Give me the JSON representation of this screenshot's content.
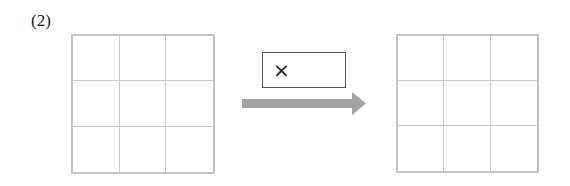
{
  "problem": {
    "number_label": "(2)",
    "operation_symbol": "×",
    "operation_icon": "multiply-icon",
    "arrow_icon": "right-arrow-icon",
    "colors": {
      "grid_border": "#c4c4c4",
      "grid_lines": "#c9c9c9",
      "arrow": "#a3a3a3",
      "box_border": "#555555",
      "text": "#1a1a1a"
    },
    "input_grid": {
      "rows": 3,
      "cols": 3,
      "cells": [
        "",
        "",
        "",
        "",
        "",
        "",
        "",
        "",
        ""
      ]
    },
    "output_grid": {
      "rows": 3,
      "cols": 3,
      "cells": [
        "",
        "",
        "",
        "",
        "",
        "",
        "",
        "",
        ""
      ]
    }
  }
}
